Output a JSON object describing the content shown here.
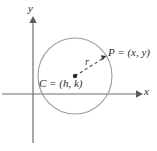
{
  "figure": {
    "background_color": "#ffffff",
    "width": 157,
    "height": 151
  },
  "axes": {
    "x_label": "x",
    "y_label": "y",
    "color": "#6e6e6e",
    "origin": {
      "x": 33,
      "y": 94
    },
    "x_axis": {
      "start_x": 2,
      "end_x": 141,
      "y": 94,
      "arrow": "right"
    },
    "y_axis": {
      "x": 33,
      "start_y": 143,
      "end_y": 17,
      "arrow": "up"
    }
  },
  "circle": {
    "name": "circle",
    "center": {
      "x": 75,
      "y": 76
    },
    "radius_x": 37,
    "radius_y": 38,
    "stroke_color": "#9a9a9a",
    "stroke_width": 1,
    "fill": "none"
  },
  "center_point": {
    "label": "C = (h, k)",
    "dot": {
      "x": 75,
      "y": 76
    },
    "dot_color": "#2b2b2b",
    "dot_radius": 2
  },
  "outer_point": {
    "label": "P = (x, y)",
    "dot": {
      "x": 105,
      "y": 57
    }
  },
  "radius_segment": {
    "label": "r",
    "from": {
      "x": 75,
      "y": 76
    },
    "to": {
      "x": 105,
      "y": 57
    },
    "style": "dashed",
    "color": "#4a4a4a",
    "arrow": "to-P"
  }
}
